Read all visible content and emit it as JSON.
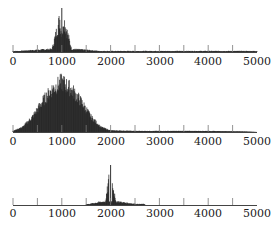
{
  "chart_data": [
    {
      "type": "area",
      "title": "",
      "xlabel": "",
      "ylabel": "",
      "xlim": [
        0,
        5000
      ],
      "x_ticks": [
        0,
        1000,
        2000,
        3000,
        4000,
        5000
      ],
      "minor_ticks": [
        500,
        1500,
        2500,
        3500,
        4500
      ],
      "grid": false,
      "description": "Spectrum with single narrow spike at 1000 over low broad hump (0-1800)",
      "series": [
        {
          "name": "spectrum",
          "x": [
            0,
            200,
            500,
            800,
            1000,
            1200,
            1500,
            1800,
            2000,
            3000,
            4000,
            4750,
            5000
          ],
          "values": [
            0.01,
            0.03,
            0.05,
            0.07,
            1.0,
            0.07,
            0.05,
            0.02,
            0.01,
            0.005,
            0.005,
            0.005,
            0
          ]
        }
      ],
      "spike": {
        "x": 1000,
        "relative_height": 1.0
      }
    },
    {
      "type": "area",
      "title": "",
      "xlabel": "",
      "ylabel": "",
      "xlim": [
        0,
        5000
      ],
      "x_ticks": [
        0,
        1000,
        2000,
        3000,
        4000,
        5000
      ],
      "minor_ticks": [
        500,
        1500,
        2500,
        3500,
        4500
      ],
      "grid": false,
      "description": "Dense broadband spectrum centered near 1000, spanning ~0-2000, low tail to ~4800",
      "series": [
        {
          "name": "spectrum",
          "x": [
            0,
            200,
            400,
            600,
            800,
            1000,
            1200,
            1400,
            1600,
            1800,
            2000,
            2500,
            3000,
            4000,
            4750,
            5000
          ],
          "values": [
            0.02,
            0.1,
            0.3,
            0.6,
            0.85,
            1.0,
            0.85,
            0.6,
            0.3,
            0.1,
            0.03,
            0.02,
            0.02,
            0.02,
            0.01,
            0
          ]
        }
      ]
    },
    {
      "type": "area",
      "title": "",
      "xlabel": "",
      "ylabel": "",
      "xlim": [
        0,
        5000
      ],
      "x_ticks": [
        0,
        1000,
        2000,
        3000,
        4000,
        5000
      ],
      "minor_ticks": [
        500,
        1500,
        2500,
        3500,
        4500
      ],
      "grid": false,
      "description": "Spectrum with single narrow spike at 2000 over low hump (1500-2700)",
      "series": [
        {
          "name": "spectrum",
          "x": [
            1500,
            1700,
            1900,
            2000,
            2100,
            2300,
            2500,
            2700
          ],
          "values": [
            0.01,
            0.06,
            0.1,
            1.0,
            0.1,
            0.06,
            0.03,
            0.01
          ]
        }
      ],
      "spike": {
        "x": 2000,
        "relative_height": 1.0
      }
    }
  ],
  "panels": [
    {
      "tick_labels": [
        "0",
        "1000",
        "2000",
        "3000",
        "4000",
        "5000"
      ]
    },
    {
      "tick_labels": [
        "0",
        "1000",
        "2000",
        "3000",
        "4000",
        "5000"
      ]
    },
    {
      "tick_labels": [
        "0",
        "1000",
        "2000",
        "3000",
        "4000",
        "5000"
      ]
    }
  ],
  "colors": {
    "ink": "#1a1a1a",
    "axis": "#444444",
    "background": "#ffffff"
  }
}
